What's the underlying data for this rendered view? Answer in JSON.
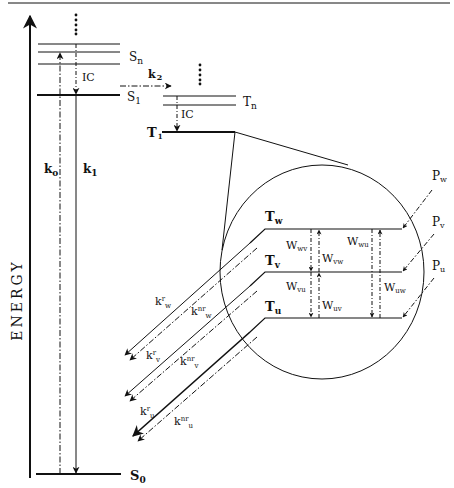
{
  "diagram": {
    "type": "Jablonski energy-level diagram with triplet sublevels",
    "axis_label": "ENERGY",
    "colors": {
      "ink": "#111111",
      "background": "#ffffff"
    },
    "singlet_levels": {
      "Sn": {
        "main": "S",
        "sub": "n"
      },
      "S1": {
        "main": "S",
        "sub": "1"
      },
      "S0": {
        "main": "S",
        "sub": "0"
      }
    },
    "triplet_levels": {
      "Tn": {
        "main": "T",
        "sub": "n"
      },
      "T1": {
        "main": "T",
        "sub": "1"
      }
    },
    "sublevels": {
      "Tw": {
        "main": "T",
        "sub": "w"
      },
      "Tv": {
        "main": "T",
        "sub": "v"
      },
      "Tu": {
        "main": "T",
        "sub": "u"
      }
    },
    "processes": {
      "ic_singlet": "IC",
      "ic_triplet": "IC",
      "k0": {
        "main": "k",
        "sub": "o"
      },
      "k1": {
        "main": "k",
        "sub": "1"
      },
      "k2": {
        "main": "k",
        "sub": "2"
      }
    },
    "sublevel_rates": {
      "Wwv": {
        "main": "W",
        "sub": "wv"
      },
      "Wvw": {
        "main": "W",
        "sub": "vw"
      },
      "Wwu": {
        "main": "W",
        "sub": "wu"
      },
      "Wvu": {
        "main": "W",
        "sub": "vu"
      },
      "Wuv": {
        "main": "W",
        "sub": "uv"
      },
      "Wuw": {
        "main": "W",
        "sub": "uw"
      }
    },
    "populations": {
      "Pw": {
        "main": "P",
        "sub": "w"
      },
      "Pv": {
        "main": "P",
        "sub": "v"
      },
      "Pu": {
        "main": "P",
        "sub": "u"
      }
    },
    "decay_rates": {
      "krw": {
        "main": "k",
        "sup": "r",
        "sub": "w"
      },
      "knrw": {
        "main": "k",
        "sup": "nr",
        "sub": "w"
      },
      "krv": {
        "main": "k",
        "sup": "r",
        "sub": "v"
      },
      "knrv": {
        "main": "k",
        "sup": "nr",
        "sub": "v"
      },
      "kru": {
        "main": "k",
        "sup": "r",
        "sub": "u"
      },
      "knru": {
        "main": "k",
        "sup": "nr",
        "sub": "u"
      }
    },
    "ellipsis": "⋮"
  }
}
